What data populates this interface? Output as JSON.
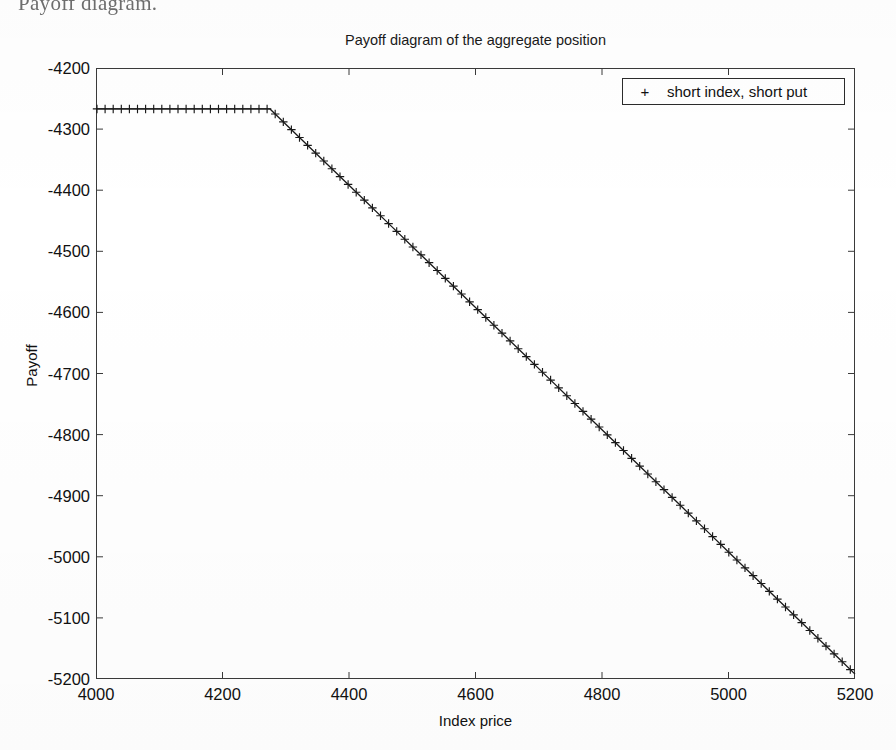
{
  "page": {
    "caption_fragment": "Payoff diagram."
  },
  "figure": {
    "title": "Payoff diagram of the aggregate position",
    "x_axis_title": "Index price",
    "y_axis_title": "Payoff",
    "legend": {
      "marker": "+",
      "label": "short index, short put",
      "position": "top-right"
    }
  },
  "chart_data": {
    "type": "line",
    "title": "Payoff diagram of the aggregate position",
    "xlabel": "Index price",
    "ylabel": "Payoff",
    "xlim": [
      4000,
      5200
    ],
    "ylim": [
      -5200,
      -4200
    ],
    "xticks": [
      4000,
      4200,
      4400,
      4600,
      4800,
      5000,
      5200
    ],
    "yticks": [
      -4200,
      -4300,
      -4400,
      -4500,
      -4600,
      -4700,
      -4800,
      -4900,
      -5000,
      -5100,
      -5200
    ],
    "grid": false,
    "marker": "+",
    "marker_color": "#1a1a1a",
    "line_color": "#1a1a1a",
    "series": [
      {
        "name": "short index, short put",
        "breakpoint_x": 4275,
        "plateau_y": -4267,
        "slope": -1.0,
        "x": [
          4000,
          4025,
          4050,
          4075,
          4100,
          4125,
          4150,
          4175,
          4200,
          4225,
          4250,
          4275,
          4300,
          4325,
          4350,
          4375,
          4400,
          4425,
          4450,
          4475,
          4500,
          4525,
          4550,
          4575,
          4600,
          4625,
          4650,
          4675,
          4700,
          4725,
          4750,
          4775,
          4800,
          4825,
          4850,
          4875,
          4900,
          4925,
          4950,
          4975,
          5000,
          5025,
          5050,
          5075,
          5100,
          5125,
          5150,
          5175,
          5200
        ],
        "y": [
          -4267,
          -4267,
          -4267,
          -4267,
          -4267,
          -4267,
          -4267,
          -4267,
          -4267,
          -4267,
          -4267,
          -4267,
          -4292,
          -4317,
          -4342,
          -4367,
          -4392,
          -4417,
          -4442,
          -4467,
          -4492,
          -4517,
          -4542,
          -4567,
          -4592,
          -4617,
          -4642,
          -4667,
          -4692,
          -4717,
          -4742,
          -4767,
          -4792,
          -4817,
          -4842,
          -4867,
          -4892,
          -4917,
          -4942,
          -4967,
          -4992,
          -5017,
          -5042,
          -5067,
          -5092,
          -5117,
          -5142,
          -5167,
          -5192
        ]
      }
    ]
  }
}
